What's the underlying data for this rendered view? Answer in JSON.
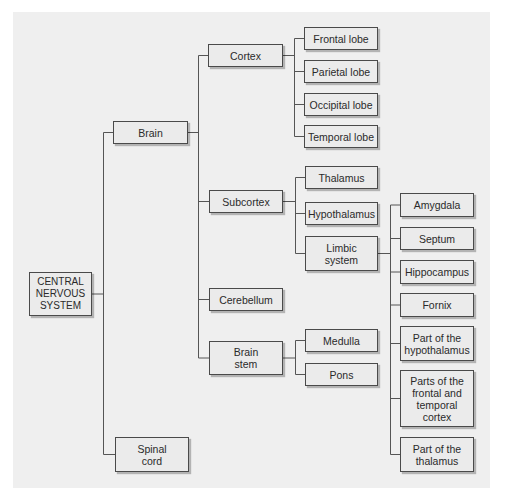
{
  "diagram": {
    "type": "tree",
    "root": "CENTRAL\nNERVOUS\nSYSTEM",
    "nodes": {
      "cns": "CENTRAL\nNERVOUS\nSYSTEM",
      "brain": "Brain",
      "spinal_cord": "Spinal\ncord",
      "cortex": "Cortex",
      "subcortex": "Subcortex",
      "cerebellum": "Cerebellum",
      "brain_stem": "Brain\nstem",
      "frontal_lobe": "Frontal lobe",
      "parietal_lobe": "Parietal lobe",
      "occipital_lobe": "Occipital lobe",
      "temporal_lobe": "Temporal lobe",
      "thalamus": "Thalamus",
      "hypothalamus": "Hypothalamus",
      "limbic_system": "Limbic\nsystem",
      "medulla": "Medulla",
      "pons": "Pons",
      "amygdala": "Amygdala",
      "septum": "Septum",
      "hippocampus": "Hippocampus",
      "fornix": "Fornix",
      "part_hypothalamus": "Part of the\nhypothalamus",
      "parts_frontal_temporal": "Parts of the\nfrontal and\ntemporal\ncortex",
      "part_thalamus": "Part of the\nthalamus"
    },
    "edges": [
      [
        "cns",
        "brain"
      ],
      [
        "cns",
        "spinal_cord"
      ],
      [
        "brain",
        "cortex"
      ],
      [
        "brain",
        "subcortex"
      ],
      [
        "brain",
        "cerebellum"
      ],
      [
        "brain",
        "brain_stem"
      ],
      [
        "cortex",
        "frontal_lobe"
      ],
      [
        "cortex",
        "parietal_lobe"
      ],
      [
        "cortex",
        "occipital_lobe"
      ],
      [
        "cortex",
        "temporal_lobe"
      ],
      [
        "subcortex",
        "thalamus"
      ],
      [
        "subcortex",
        "hypothalamus"
      ],
      [
        "subcortex",
        "limbic_system"
      ],
      [
        "brain_stem",
        "medulla"
      ],
      [
        "brain_stem",
        "pons"
      ],
      [
        "limbic_system",
        "amygdala"
      ],
      [
        "limbic_system",
        "septum"
      ],
      [
        "limbic_system",
        "hippocampus"
      ],
      [
        "limbic_system",
        "fornix"
      ],
      [
        "limbic_system",
        "part_hypothalamus"
      ],
      [
        "limbic_system",
        "parts_frontal_temporal"
      ],
      [
        "limbic_system",
        "part_thalamus"
      ]
    ]
  }
}
